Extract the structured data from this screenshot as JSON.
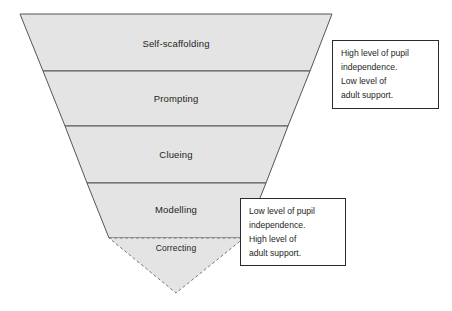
{
  "diagram": {
    "type": "inverted-triangle-funnel",
    "colors": {
      "tier_fill": "#e4e4e4",
      "tier_stroke": "#555555",
      "dashed_stroke": "#777777",
      "text": "#231f20",
      "box_border": "#2b2b2b",
      "background": "#ffffff"
    },
    "tiers": [
      {
        "label": "Self-scaffolding",
        "style": "solid"
      },
      {
        "label": "Prompting",
        "style": "solid"
      },
      {
        "label": "Clueing",
        "style": "solid"
      },
      {
        "label": "Modelling",
        "style": "solid"
      },
      {
        "label": "Correcting",
        "style": "dashed"
      }
    ]
  },
  "notes": {
    "top": {
      "lines": [
        "High level of pupil",
        "independence.",
        "Low level of",
        "adult support."
      ]
    },
    "bottom": {
      "lines": [
        "Low level of pupil",
        "independence.",
        "High level of",
        "adult support."
      ]
    }
  }
}
